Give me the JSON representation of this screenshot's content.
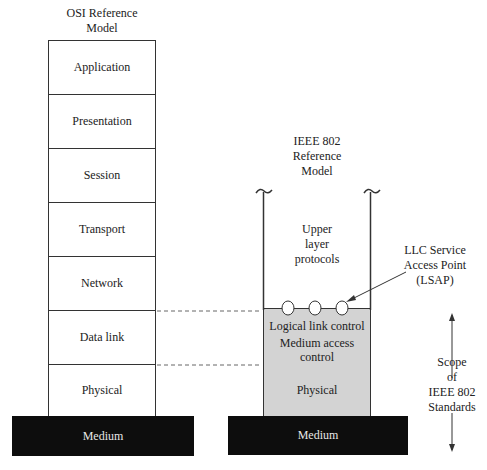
{
  "osi": {
    "title_line1": "OSI Reference",
    "title_line2": "Model",
    "layers": [
      "Application",
      "Presentation",
      "Session",
      "Transport",
      "Network",
      "Data link",
      "Physical"
    ],
    "medium": "Medium"
  },
  "ieee": {
    "title_line1": "IEEE 802",
    "title_line2": "Reference",
    "title_line3": "Model",
    "upper_line1": "Upper",
    "upper_line2": "layer",
    "upper_line3": "protocols",
    "llc": "Logical link control",
    "mac_line1": "Medium access",
    "mac_line2": "control",
    "physical": "Physical",
    "medium": "Medium"
  },
  "annotations": {
    "lsap_line1": "LLC Service",
    "lsap_line2": "Access Point",
    "lsap_line3": "(LSAP)",
    "scope_line1": "Scope",
    "scope_line2": "of",
    "scope_line3": "IEEE 802",
    "scope_line4": "Standards"
  },
  "colors": {
    "medium_fill": "#0d0d0d",
    "ieee_layer_fill": "#d3d3d3",
    "line": "#333333"
  }
}
